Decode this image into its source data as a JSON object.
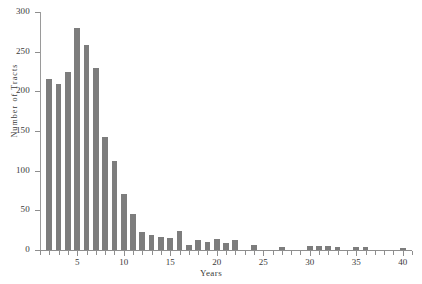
{
  "chart_data": {
    "type": "bar",
    "title": "",
    "subtitle": "",
    "xlabel": "Years",
    "ylabel": "Number of Tracts",
    "xlim": [
      1,
      41
    ],
    "ylim": [
      0,
      300
    ],
    "grid": false,
    "legend": null,
    "bar_color": "#7d7d7d",
    "axis_color": "#8e8e8e",
    "text_color": "#3a3a3a",
    "background": "#ffffff",
    "y_ticks": [
      0,
      50,
      100,
      150,
      200,
      250,
      300
    ],
    "y_tick_labels": [
      "0",
      "50",
      "100",
      "150",
      "200",
      "250",
      "300"
    ],
    "x_ticks": [
      5,
      10,
      15,
      20,
      25,
      30,
      35,
      40
    ],
    "x_tick_labels": [
      "5",
      "10",
      "15",
      "20",
      "25",
      "30",
      "35",
      "40"
    ],
    "x_minor_ticks": [
      1,
      2,
      3,
      4,
      6,
      7,
      8,
      9,
      11,
      12,
      13,
      14,
      16,
      17,
      18,
      19,
      21,
      22,
      23,
      24,
      26,
      27,
      28,
      29,
      31,
      32,
      33,
      34,
      36,
      37,
      38,
      39,
      41
    ],
    "categories": [
      2,
      3,
      4,
      5,
      6,
      7,
      8,
      9,
      10,
      11,
      12,
      13,
      14,
      15,
      16,
      17,
      18,
      19,
      20,
      21,
      22,
      24,
      27,
      30,
      31,
      32,
      33,
      35,
      36,
      40
    ],
    "values": [
      215,
      209,
      225,
      280,
      258,
      230,
      142,
      112,
      70,
      45,
      23,
      19,
      17,
      15,
      24,
      6,
      12,
      10,
      14,
      9,
      12,
      6,
      4,
      5,
      5,
      5,
      4,
      4,
      4,
      3
    ],
    "series": [
      {
        "name": "Number of Tracts",
        "values": [
          215,
          209,
          225,
          280,
          258,
          230,
          142,
          112,
          70,
          45,
          23,
          19,
          17,
          15,
          24,
          6,
          12,
          10,
          14,
          9,
          12,
          6,
          4,
          5,
          5,
          5,
          4,
          4,
          4,
          3
        ]
      }
    ]
  }
}
